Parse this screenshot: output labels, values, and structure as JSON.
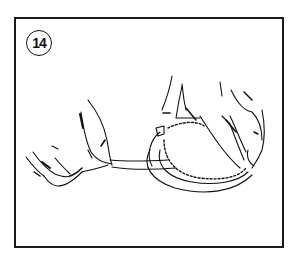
{
  "figure": {
    "step_number": "14",
    "colors": {
      "line": "#111111",
      "background": "#ffffff",
      "border": "#1a1a1a"
    }
  }
}
